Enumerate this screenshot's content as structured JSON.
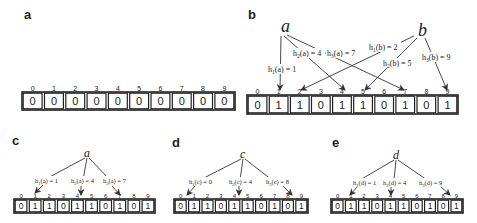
{
  "figure": {
    "panels": [
      {
        "id": "a",
        "label": "a",
        "node": null,
        "indices": [
          "0",
          "1",
          "2",
          "3",
          "4",
          "5",
          "6",
          "7",
          "8",
          "9"
        ],
        "bits": [
          "0",
          "0",
          "0",
          "0",
          "0",
          "0",
          "0",
          "0",
          "0",
          "0"
        ],
        "hashes": []
      },
      {
        "id": "b",
        "label": "b",
        "nodes": [
          "a",
          "b"
        ],
        "indices": [
          "0",
          "1",
          "2",
          "3",
          "4",
          "5",
          "6",
          "7",
          "8",
          "9"
        ],
        "bits": [
          "0",
          "1",
          "1",
          "0",
          "1",
          "1",
          "0",
          "1",
          "0",
          "1"
        ],
        "hashes": [
          {
            "text": "h1(a) = 1",
            "h": "h",
            "sub": "1",
            "arg": "(a) = 1",
            "source": "a",
            "target": 1
          },
          {
            "text": "h2(a) = 4",
            "h": "h",
            "sub": "2",
            "arg": "(a) = 4",
            "source": "a",
            "target": 4
          },
          {
            "text": "h3(a) = 7",
            "h": "h",
            "sub": "3",
            "arg": "(a) = 7",
            "source": "a",
            "target": 7
          },
          {
            "text": "h1(b) = 2",
            "h": "h",
            "sub": "1",
            "arg": "(b) = 2",
            "source": "b",
            "target": 2
          },
          {
            "text": "h2(b) = 5",
            "h": "h",
            "sub": "2",
            "arg": "(b) = 5",
            "source": "b",
            "target": 5
          },
          {
            "text": "h3(b) = 9",
            "h": "h",
            "sub": "3",
            "arg": "(b) = 9",
            "source": "b",
            "target": 9
          }
        ]
      },
      {
        "id": "c",
        "label": "c",
        "node": "a",
        "indices": [
          "0",
          "1",
          "2",
          "3",
          "4",
          "5",
          "6",
          "7",
          "8",
          "9"
        ],
        "bits": [
          "0",
          "1",
          "1",
          "0",
          "1",
          "1",
          "0",
          "1",
          "0",
          "1"
        ],
        "hashes": [
          {
            "text": "h1(a) = 1",
            "h": "h",
            "sub": "1",
            "arg": "(a) = 1",
            "target": 1
          },
          {
            "text": "h2(a) = 4",
            "h": "h",
            "sub": "2",
            "arg": "(a) = 4",
            "target": 4
          },
          {
            "text": "h3(a) = 7",
            "h": "h",
            "sub": "3",
            "arg": "(a) = 7",
            "target": 7
          }
        ]
      },
      {
        "id": "d",
        "label": "d",
        "node": "c",
        "indices": [
          "0",
          "1",
          "2",
          "3",
          "4",
          "5",
          "6",
          "7",
          "8",
          "9"
        ],
        "bits": [
          "0",
          "1",
          "1",
          "0",
          "1",
          "1",
          "0",
          "1",
          "0",
          "1"
        ],
        "hashes": [
          {
            "text": "h1(c) = 0",
            "h": "h",
            "sub": "1",
            "arg": "(c) = 0",
            "target": 0
          },
          {
            "text": "h2(c) = 4",
            "h": "h",
            "sub": "2",
            "arg": "(c) = 4",
            "target": 4
          },
          {
            "text": "h3(c) = 8",
            "h": "h",
            "sub": "3",
            "arg": "(c) = 8",
            "target": 8
          }
        ]
      },
      {
        "id": "e",
        "label": "e",
        "node": "d",
        "indices": [
          "0",
          "1",
          "2",
          "3",
          "4",
          "5",
          "6",
          "7",
          "8",
          "9"
        ],
        "bits": [
          "0",
          "1",
          "1",
          "0",
          "1",
          "1",
          "0",
          "1",
          "0",
          "1"
        ],
        "hashes": [
          {
            "text": "h1(d) = 1",
            "h": "h",
            "sub": "1",
            "arg": "(d) = 1",
            "target": 1
          },
          {
            "text": "h2(d) = 4",
            "h": "h",
            "sub": "2",
            "arg": "(d) = 4",
            "target": 4
          },
          {
            "text": "h3(d) = 9",
            "h": "h",
            "sub": "3",
            "arg": "(d) = 9",
            "target": 9
          }
        ]
      }
    ]
  }
}
